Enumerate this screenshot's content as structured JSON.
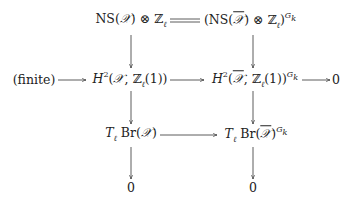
{
  "diagram": {
    "type": "commutative-diagram",
    "nodes": {
      "ns_x": {
        "base": "NS(",
        "var": "𝒳",
        "tail": ") ⊗ ℤ",
        "sub": "ℓ"
      },
      "ns_xbar": {
        "open": "(NS(",
        "var": "𝒳",
        "mid": ") ⊗ ℤ",
        "sub": "ℓ",
        "close": ")",
        "sup": "G",
        "supsub": "k"
      },
      "finite": "(finite)",
      "h2_x": {
        "base": "H",
        "deg": "2",
        "open": "(",
        "var": "𝒳",
        "mid": ", ℤ",
        "sub": "ℓ",
        "tail": "(1))"
      },
      "h2_xbar": {
        "base": "H",
        "deg": "2",
        "open": "(",
        "var": "𝒳",
        "mid": ", ℤ",
        "sub": "ℓ",
        "tail": "(1))",
        "sup": "G",
        "supsub": "k"
      },
      "zero_right": "0",
      "tbr_x": {
        "T": "T",
        "sub": "ℓ",
        "br": " Br(",
        "var": "𝒳",
        "tail": ")"
      },
      "tbr_xbar": {
        "T": "T",
        "sub": "ℓ",
        "br": " Br(",
        "var": "𝒳",
        "tail": ")",
        "sup": "G",
        "supsub": "k"
      },
      "zero_left_bottom": "0",
      "zero_right_bottom": "0"
    },
    "edges": [
      {
        "from": "ns_x",
        "to": "ns_xbar",
        "style": "equals"
      },
      {
        "from": "ns_x",
        "to": "h2_x",
        "style": "arrow"
      },
      {
        "from": "ns_xbar",
        "to": "h2_xbar",
        "style": "arrow"
      },
      {
        "from": "finite",
        "to": "h2_x",
        "style": "arrow"
      },
      {
        "from": "h2_x",
        "to": "h2_xbar",
        "style": "arrow"
      },
      {
        "from": "h2_xbar",
        "to": "zero_right",
        "style": "arrow"
      },
      {
        "from": "h2_x",
        "to": "tbr_x",
        "style": "arrow"
      },
      {
        "from": "h2_xbar",
        "to": "tbr_xbar",
        "style": "arrow"
      },
      {
        "from": "tbr_x",
        "to": "tbr_xbar",
        "style": "arrow"
      },
      {
        "from": "tbr_x",
        "to": "zero_left_bottom",
        "style": "arrow"
      },
      {
        "from": "tbr_xbar",
        "to": "zero_right_bottom",
        "style": "arrow"
      }
    ]
  }
}
